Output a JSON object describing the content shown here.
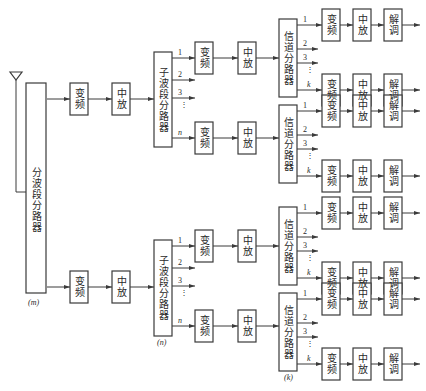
{
  "labels": {
    "main_splitter": "分波段分路器",
    "main_splitter_tag": "(m)",
    "freq_conv": "变频",
    "if_amp": "中放",
    "sub_band_splitter": "子波段分路器",
    "sub_band_tag": "(n)",
    "channel_splitter": "信道分路器",
    "channel_tag": "(k)",
    "demod": "解调"
  },
  "port_labels": {
    "sub_band": [
      "1",
      "2",
      "3",
      "⋮",
      "n"
    ],
    "channel": [
      "1",
      "2",
      "3",
      "⋮",
      "k"
    ]
  },
  "icons": {
    "antenna": "antenna-icon"
  }
}
